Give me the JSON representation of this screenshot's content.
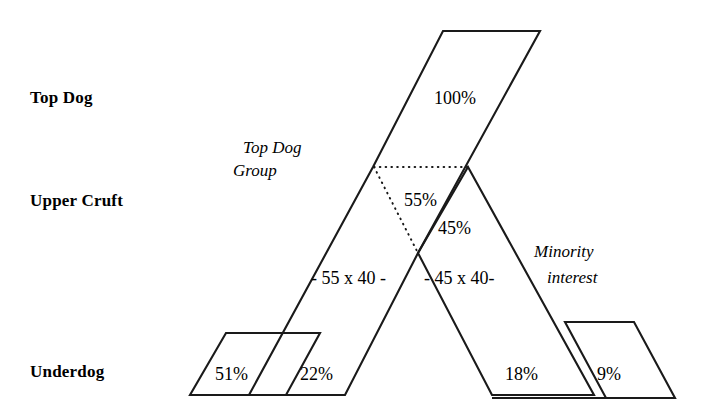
{
  "diagram": {
    "type": "ownership-structure-diagram",
    "background_color": "#ffffff",
    "line_color": "#1a1a1a",
    "row_labels": [
      {
        "id": "top-dog",
        "text": "Top Dog"
      },
      {
        "id": "upper-cruft",
        "text": "Upper Cruft"
      },
      {
        "id": "underdog",
        "text": "Underdog"
      }
    ],
    "annotations": [
      {
        "id": "top-dog-group",
        "line1": "Top Dog",
        "line2": "Group",
        "style": "italic"
      },
      {
        "id": "minority-interest",
        "line1": "Minority",
        "line2": "interest",
        "style": "italic"
      }
    ],
    "bands": [
      {
        "id": "top-dog-band",
        "label": "100%",
        "row": "top-dog"
      },
      {
        "id": "upper-cruft-majority",
        "label": "55%",
        "row": "upper-cruft"
      },
      {
        "id": "upper-cruft-minority",
        "label": "45%",
        "row": "upper-cruft"
      },
      {
        "id": "underdog-51",
        "label": "51%",
        "row": "underdog"
      },
      {
        "id": "underdog-22",
        "label": "22%",
        "row": "underdog"
      },
      {
        "id": "underdog-18",
        "label": "18%",
        "row": "underdog"
      },
      {
        "id": "underdog-9",
        "label": "9%",
        "row": "underdog"
      }
    ],
    "calculations": [
      {
        "id": "calc-left",
        "text": "- 55 x 40 -"
      },
      {
        "id": "calc-right",
        "text": "- 45 x 40-"
      }
    ]
  }
}
